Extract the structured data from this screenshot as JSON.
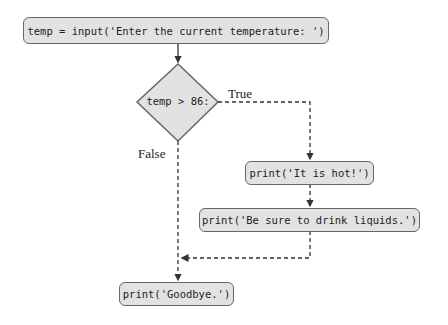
{
  "flowchart": {
    "nodes": {
      "input": "temp = input('Enter the current temperature: ')",
      "decision": "temp > 86:",
      "hot": "print('It is hot!')",
      "liquids": "print('Be sure to drink liquids.')",
      "goodbye": "print('Goodbye.')"
    },
    "edges": {
      "true_label": "True",
      "false_label": "False"
    },
    "colors": {
      "node_fill": "#e2e2e2",
      "node_border": "#666666",
      "line": "#333333"
    }
  }
}
